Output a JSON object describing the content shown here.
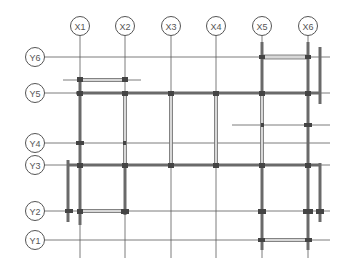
{
  "diagram": {
    "type": "structural-grid-plan",
    "columns": [
      {
        "label": "X1",
        "x": 80
      },
      {
        "label": "X2",
        "x": 125
      },
      {
        "label": "X3",
        "x": 171
      },
      {
        "label": "X4",
        "x": 216
      },
      {
        "label": "X5",
        "x": 262
      },
      {
        "label": "X6",
        "x": 308
      }
    ],
    "rows": [
      {
        "label": "Y6",
        "y": 57
      },
      {
        "label": "Y5",
        "y": 93
      },
      {
        "label": "Y4",
        "y": 143
      },
      {
        "label": "Y3",
        "y": 165
      },
      {
        "label": "Y2",
        "y": 211
      },
      {
        "label": "Y1",
        "y": 240
      }
    ],
    "colors": {
      "line": "#5a5a5a",
      "beam": "#6a6a6a",
      "beam_fill": "#d8d8d8",
      "background": "#ffffff"
    }
  }
}
